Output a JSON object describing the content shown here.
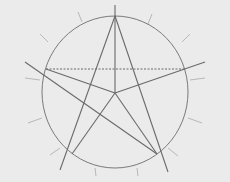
{
  "diagram": {
    "title": "",
    "colors": {
      "background": "#ebebeb",
      "line": "#6a6a6a",
      "tick": "#b8b8b8",
      "circle": "#7a7a7a"
    },
    "circle": {
      "cx": 115,
      "cy": 92,
      "rx": 73,
      "ry": 76
    },
    "center": {
      "x": 115,
      "y": 93
    },
    "vertices": {
      "top": [
        115,
        16
      ],
      "left": [
        46,
        69
      ],
      "right": [
        186,
        69
      ],
      "bottom_left": [
        72,
        154
      ],
      "bottom_right": [
        157,
        154
      ]
    },
    "lines": [
      {
        "name": "vertical-axis-line",
        "x1": 115,
        "y1": 5,
        "x2": 115,
        "y2": 93
      },
      {
        "name": "top-to-bottom-left-line",
        "x1": 115,
        "y1": 16,
        "x2": 60,
        "y2": 170
      },
      {
        "name": "top-to-bottom-right-line",
        "x1": 115,
        "y1": 16,
        "x2": 168,
        "y2": 172
      },
      {
        "name": "left-to-bottom-right-line",
        "x1": 25,
        "y1": 62,
        "x2": 157,
        "y2": 154
      },
      {
        "name": "center-to-left-line",
        "x1": 46,
        "y1": 69,
        "x2": 115,
        "y2": 93
      },
      {
        "name": "center-to-right-line",
        "x1": 115,
        "y1": 93,
        "x2": 205,
        "y2": 62
      },
      {
        "name": "center-to-bottom-left-line",
        "x1": 115,
        "y1": 93,
        "x2": 72,
        "y2": 154
      },
      {
        "name": "center-to-bottom-right-line",
        "x1": 115,
        "y1": 93,
        "x2": 157,
        "y2": 154
      }
    ],
    "dashed_lines": [
      {
        "name": "horizontal-dashed-chord",
        "x1": 46,
        "y1": 69,
        "x2": 186,
        "y2": 69
      }
    ],
    "ticks": [
      [
        78,
        12,
        82,
        22
      ],
      [
        152,
        14,
        148,
        24
      ],
      [
        40,
        34,
        48,
        42
      ],
      [
        190,
        34,
        182,
        42
      ],
      [
        25,
        78,
        40,
        80
      ],
      [
        190,
        80,
        205,
        78
      ],
      [
        28,
        123,
        42,
        118
      ],
      [
        188,
        118,
        202,
        123
      ],
      [
        50,
        155,
        60,
        148
      ],
      [
        168,
        148,
        178,
        156
      ],
      [
        95,
        168,
        96,
        176
      ],
      [
        137,
        168,
        138,
        176
      ]
    ]
  }
}
